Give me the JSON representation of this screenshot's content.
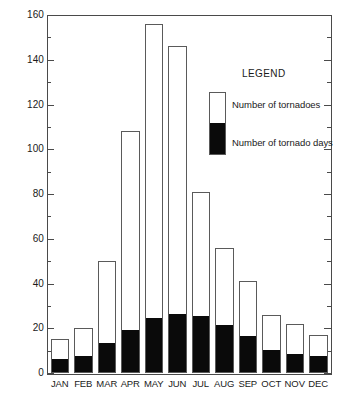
{
  "chart_data": {
    "type": "bar",
    "subtype": "overlaid-bar",
    "title": "",
    "xlabel": "",
    "ylabel": "",
    "ylim": [
      0,
      160
    ],
    "y_major_step": 20,
    "y_minor_step": 10,
    "grid": false,
    "categories": [
      "JAN",
      "FEB",
      "MAR",
      "APR",
      "MAY",
      "JUN",
      "JUL",
      "AUG",
      "SEP",
      "OCT",
      "NOV",
      "DEC"
    ],
    "y_tick_labels": [
      "0",
      "20",
      "40",
      "60",
      "80",
      "100",
      "120",
      "140",
      "160"
    ],
    "series": [
      {
        "name": "Number of tornadoes",
        "color": "#ffffff",
        "values": [
          15,
          20,
          50,
          108,
          156,
          146,
          81,
          56,
          41,
          26,
          22,
          17
        ]
      },
      {
        "name": "Number of tornado days",
        "color": "#0a0a0a",
        "values": [
          6,
          7,
          13,
          19,
          24,
          26,
          25,
          21,
          16,
          10,
          8,
          7
        ]
      }
    ],
    "legend": {
      "position": "inside-top-right",
      "title": "LEGEND",
      "entries": [
        {
          "label": "Number of tornadoes",
          "color": "#ffffff"
        },
        {
          "label": "Number of tornado days",
          "color": "#0a0a0a"
        }
      ]
    },
    "axis_color": "#4a4a4a",
    "bar_outline_color": "#5a5a5a"
  }
}
